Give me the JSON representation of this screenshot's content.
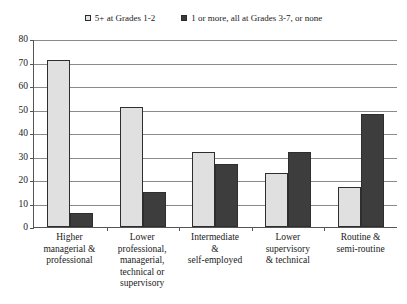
{
  "chart_data": {
    "type": "bar",
    "title": "",
    "xlabel": "",
    "ylabel": "",
    "ylim": [
      0,
      80
    ],
    "ytick_step": 10,
    "yticks": [
      0,
      10,
      20,
      30,
      40,
      50,
      60,
      70,
      80
    ],
    "grid": true,
    "legend_position": "top",
    "categories": [
      "Higher managerial & professional",
      "Lower professional, managerial, technical or supervisory",
      "Intermediate & self-employed",
      "Lower supervisory & technical",
      "Routine & semi-routine"
    ],
    "category_lines": [
      [
        "Higher",
        "managerial &",
        "professional"
      ],
      [
        "Lower",
        "professional,",
        "managerial,",
        "technical or",
        "supervisory"
      ],
      [
        "Intermediate",
        "&",
        "self-employed"
      ],
      [
        "Lower",
        "supervisory",
        "& technical"
      ],
      [
        "Routine &",
        "semi-routine"
      ]
    ],
    "series": [
      {
        "name": "5+ at Grades  1-2",
        "color": "#e0e0e0",
        "values": [
          71,
          51,
          32,
          23,
          17
        ]
      },
      {
        "name": "1 or more, all at Grades 3-7, or none",
        "color": "#3d3d3d",
        "values": [
          6,
          15,
          27,
          32,
          48
        ]
      }
    ]
  },
  "legend": {
    "entries": [
      {
        "label": "5+ at Grades  1-2",
        "swatch": "light-square-icon"
      },
      {
        "label": "1 or more, all at Grades 3-7, or none",
        "swatch": "dark-square-icon"
      }
    ]
  }
}
